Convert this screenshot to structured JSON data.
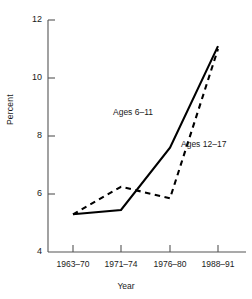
{
  "chart_data": {
    "type": "line",
    "title": "",
    "xlabel": "Year",
    "ylabel": "Percent",
    "categories": [
      "1963–70",
      "1971–74",
      "1976–80",
      "1988–91"
    ],
    "yticks": [
      4,
      6,
      8,
      10,
      12
    ],
    "ylim": [
      4,
      12
    ],
    "grid": false,
    "legend_position": "inline-annotations",
    "series": [
      {
        "name": "Ages 6–11",
        "style": "solid",
        "color": "#000000",
        "values": [
          5.3,
          5.45,
          7.6,
          11.1
        ]
      },
      {
        "name": "Ages 12–17",
        "style": "dashed",
        "color": "#000000",
        "values": [
          5.3,
          6.25,
          5.85,
          11.0
        ]
      }
    ],
    "annotations": [
      {
        "text": "Ages 6–11",
        "x_px": 113,
        "y_px": 112
      },
      {
        "text": "Ages 12–17",
        "x_px": 181,
        "y_px": 143
      }
    ]
  },
  "axis": {
    "y_tick_labels": [
      "12",
      "10",
      "8",
      "6",
      "4"
    ],
    "x_tick_labels": [
      "1963–70",
      "1971–74",
      "1976–80",
      "1988–91"
    ],
    "y_axis_title": "Percent",
    "x_axis_title": "Year",
    "axis_color": "#555555"
  }
}
